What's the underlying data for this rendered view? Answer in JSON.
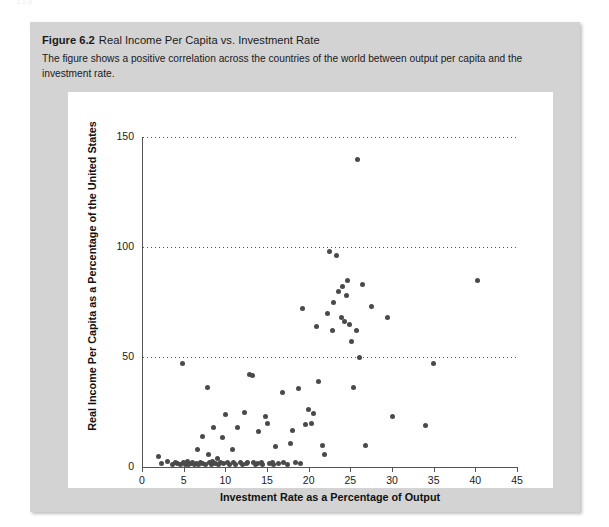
{
  "page": {
    "number": "119"
  },
  "figure": {
    "number_label": "Figure 6.2",
    "title": "Real Income Per Capita vs. Investment Rate",
    "description": "The figure shows a positive correlation across the countries of the world between output per capita and the investment rate.",
    "box_color": "#d3d3d3",
    "panel_color": "#ffffff",
    "marker_color": "#4a4a4a"
  },
  "chart_data": {
    "type": "scatter",
    "title": "Real Income Per Capita vs. Investment Rate",
    "xlabel": "Investment Rate as a Percentage of Output",
    "ylabel": "Real Income Per Capita as a Percentage of the United States",
    "xlim": [
      0,
      45
    ],
    "ylim": [
      0,
      150
    ],
    "xticks": [
      0,
      5,
      10,
      15,
      20,
      25,
      30,
      35,
      40,
      45
    ],
    "yticks": [
      0,
      50,
      100,
      150
    ],
    "grid": "horizontal-dotted",
    "legend": null,
    "points": [
      [
        2.0,
        5.0
      ],
      [
        2.3,
        1.5
      ],
      [
        3.1,
        2.5
      ],
      [
        3.6,
        1.0
      ],
      [
        4.0,
        2.0
      ],
      [
        4.3,
        1.5
      ],
      [
        4.6,
        1.0
      ],
      [
        4.8,
        47.0
      ],
      [
        5.0,
        2.0
      ],
      [
        5.2,
        1.2
      ],
      [
        5.4,
        2.5
      ],
      [
        5.6,
        1.0
      ],
      [
        5.9,
        1.8
      ],
      [
        6.1,
        2.0
      ],
      [
        6.3,
        1.0
      ],
      [
        6.5,
        1.5
      ],
      [
        6.6,
        8.0
      ],
      [
        6.8,
        1.0
      ],
      [
        7.0,
        2.0
      ],
      [
        7.2,
        14.0
      ],
      [
        7.3,
        1.5
      ],
      [
        7.6,
        1.0
      ],
      [
        7.8,
        36.0
      ],
      [
        8.0,
        5.5
      ],
      [
        8.1,
        2.0
      ],
      [
        8.3,
        1.0
      ],
      [
        8.5,
        2.5
      ],
      [
        8.6,
        18.0
      ],
      [
        8.8,
        1.5
      ],
      [
        9.0,
        4.0
      ],
      [
        9.2,
        1.0
      ],
      [
        9.4,
        2.0
      ],
      [
        9.6,
        13.5
      ],
      [
        9.8,
        1.5
      ],
      [
        10.0,
        24.0
      ],
      [
        10.2,
        2.0
      ],
      [
        10.5,
        1.0
      ],
      [
        10.8,
        8.0
      ],
      [
        11.0,
        2.0
      ],
      [
        11.2,
        1.2
      ],
      [
        11.5,
        18.0
      ],
      [
        11.8,
        2.0
      ],
      [
        12.0,
        1.0
      ],
      [
        12.3,
        25.0
      ],
      [
        12.5,
        1.5
      ],
      [
        12.7,
        2.0
      ],
      [
        12.9,
        42.0
      ],
      [
        13.2,
        41.5
      ],
      [
        13.4,
        2.0
      ],
      [
        13.6,
        1.0
      ],
      [
        13.8,
        1.5
      ],
      [
        14.0,
        16.0
      ],
      [
        14.3,
        2.0
      ],
      [
        14.5,
        1.0
      ],
      [
        14.8,
        23.0
      ],
      [
        15.0,
        20.0
      ],
      [
        15.3,
        1.5
      ],
      [
        15.6,
        2.0
      ],
      [
        15.8,
        1.0
      ],
      [
        16.0,
        9.5
      ],
      [
        16.4,
        1.5
      ],
      [
        16.8,
        34.0
      ],
      [
        17.0,
        2.0
      ],
      [
        17.5,
        1.2
      ],
      [
        17.8,
        10.5
      ],
      [
        18.0,
        16.5
      ],
      [
        18.4,
        2.0
      ],
      [
        18.8,
        35.5
      ],
      [
        19.0,
        1.5
      ],
      [
        19.3,
        72.0
      ],
      [
        19.6,
        19.5
      ],
      [
        20.0,
        26.0
      ],
      [
        20.3,
        20.0
      ],
      [
        20.6,
        24.5
      ],
      [
        20.9,
        64.0
      ],
      [
        21.2,
        39.0
      ],
      [
        21.6,
        10.0
      ],
      [
        21.9,
        5.5
      ],
      [
        22.2,
        70.0
      ],
      [
        22.5,
        98.0
      ],
      [
        22.8,
        62.0
      ],
      [
        23.0,
        75.0
      ],
      [
        23.3,
        96.0
      ],
      [
        23.6,
        80.0
      ],
      [
        23.9,
        68.0
      ],
      [
        24.1,
        82.0
      ],
      [
        24.3,
        66.0
      ],
      [
        24.5,
        78.0
      ],
      [
        24.7,
        85.0
      ],
      [
        24.9,
        65.0
      ],
      [
        25.1,
        57.0
      ],
      [
        25.4,
        36.0
      ],
      [
        25.7,
        62.0
      ],
      [
        25.9,
        140.0
      ],
      [
        26.1,
        50.0
      ],
      [
        26.4,
        83.0
      ],
      [
        26.8,
        10.0
      ],
      [
        27.5,
        73.0
      ],
      [
        29.5,
        68.0
      ],
      [
        30.0,
        23.0
      ],
      [
        34.0,
        19.0
      ],
      [
        35.0,
        47.0
      ],
      [
        40.3,
        85.0
      ]
    ]
  }
}
